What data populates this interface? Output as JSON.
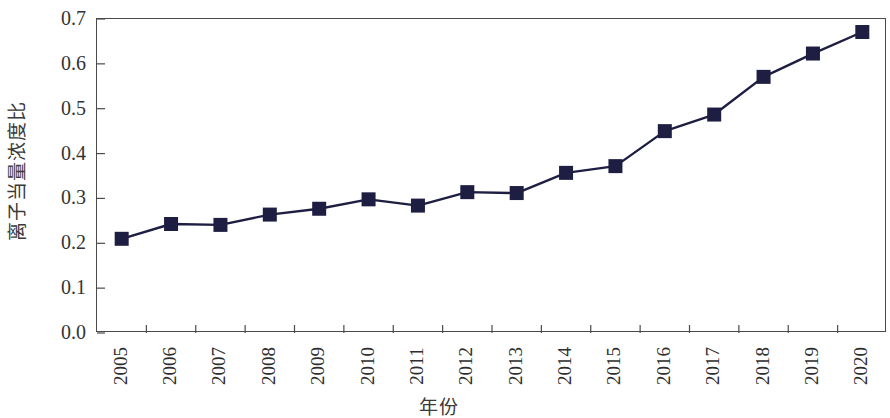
{
  "chart_data": {
    "type": "line",
    "title": "",
    "subtitle": "",
    "xlabel": "年份",
    "ylabel": "离子当量浓度比",
    "categories": [
      "2005",
      "2006",
      "2007",
      "2008",
      "2009",
      "2010",
      "2011",
      "2012",
      "2013",
      "2014",
      "2015",
      "2016",
      "2017",
      "2018",
      "2019",
      "2020"
    ],
    "x_tick_labels": [
      "2005",
      "2006",
      "2007",
      "2008",
      "2009",
      "2010",
      "2011",
      "2012",
      "2013",
      "2014",
      "2015",
      "2016",
      "2017",
      "2018",
      "2019",
      "2020"
    ],
    "y_tick_labels": [
      "0.0",
      "0.1",
      "0.2",
      "0.3",
      "0.4",
      "0.5",
      "0.6",
      "0.7"
    ],
    "y_ticks": [
      0.0,
      0.1,
      0.2,
      0.3,
      0.4,
      0.5,
      0.6,
      0.7
    ],
    "ylim": [
      0.0,
      0.7
    ],
    "xlim_index": [
      0,
      16
    ],
    "grid": false,
    "legend": false,
    "legend_position": "none",
    "series": [
      {
        "name": "离子当量浓度比",
        "marker": "square",
        "color": "#1e1e42",
        "line_color": "#1e1e42",
        "values": [
          0.21,
          0.243,
          0.241,
          0.264,
          0.277,
          0.298,
          0.284,
          0.314,
          0.312,
          0.357,
          0.372,
          0.45,
          0.487,
          0.571,
          0.623,
          0.671
        ]
      }
    ],
    "annotations": []
  },
  "axes": {
    "y_title": "离子当量浓度比",
    "x_title": "年份",
    "frame_color": "#4a4a4a",
    "tick_color": "#4a4a4a"
  },
  "colors": {
    "background": "#ffffff",
    "series_navy": "#1e1e42",
    "axis": "#4a4a4a",
    "text": "#2e2e2e"
  }
}
